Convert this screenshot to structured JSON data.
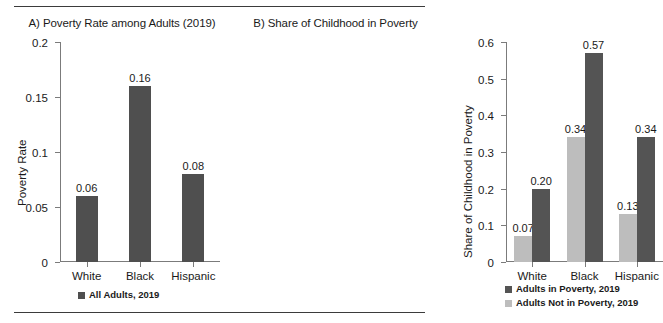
{
  "figure": {
    "rule_color": "#3b3b3b"
  },
  "panel_a": {
    "title": "A) Poverty Rate among Adults (2019)",
    "ylabel": "Poverty Rate",
    "legend": [
      {
        "label": "All Adults, 2019",
        "color": "#4f4f4f"
      }
    ]
  },
  "panel_b": {
    "title": "B) Share of Childhood in Poverty",
    "ylabel": "Share of Childhood in Poverty",
    "legend": [
      {
        "label": "Adults in Poverty, 2019",
        "color": "#545454"
      },
      {
        "label": "Adults Not in Poverty, 2019",
        "color": "#bdbdbd"
      }
    ]
  },
  "chart_data": [
    {
      "type": "bar",
      "title": "A) Poverty Rate among Adults (2019)",
      "xlabel": "",
      "ylabel": "Poverty Rate",
      "ylim": [
        0,
        0.2
      ],
      "yticks": [
        "0",
        "0.05",
        "0.1",
        "0.15",
        "0.2"
      ],
      "ytick_values": [
        0,
        0.05,
        0.1,
        0.15,
        0.2
      ],
      "grid": false,
      "legend_position": "bottom",
      "categories": [
        "White",
        "Black",
        "Hispanic"
      ],
      "series": [
        {
          "name": "All Adults, 2019",
          "color": "#4f4f4f",
          "values": [
            0.06,
            0.16,
            0.08
          ],
          "labels": [
            "0.06",
            "0.16",
            "0.08"
          ]
        }
      ]
    },
    {
      "type": "bar",
      "title": "B) Share of Childhood in Poverty",
      "xlabel": "",
      "ylabel": "Share of Childhood in Poverty",
      "ylim": [
        0,
        0.6
      ],
      "yticks": [
        "0",
        "0.1",
        "0.2",
        "0.3",
        "0.4",
        "0.5",
        "0.6"
      ],
      "ytick_values": [
        0,
        0.1,
        0.2,
        0.3,
        0.4,
        0.5,
        0.6
      ],
      "grid": false,
      "legend_position": "bottom",
      "categories": [
        "White",
        "Black",
        "Hispanic"
      ],
      "series": [
        {
          "name": "Adults Not in Poverty, 2019",
          "color": "#bdbdbd",
          "values": [
            0.07,
            0.34,
            0.13
          ],
          "labels": [
            "0.07",
            "0.34",
            "0.13"
          ]
        },
        {
          "name": "Adults in Poverty, 2019",
          "color": "#545454",
          "values": [
            0.2,
            0.57,
            0.34
          ],
          "labels": [
            "0.20",
            "0.57",
            "0.34"
          ]
        }
      ]
    }
  ]
}
